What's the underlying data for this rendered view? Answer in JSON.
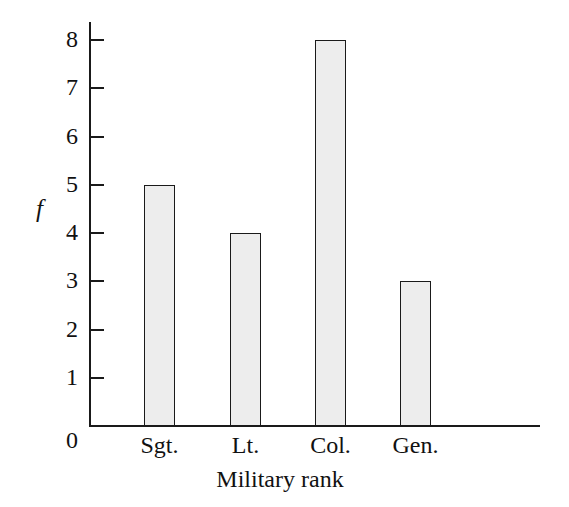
{
  "chart_data": {
    "type": "bar",
    "title": "",
    "categories": [
      "Sgt.",
      "Lt.",
      "Col.",
      "Gen."
    ],
    "values": [
      5,
      4,
      8,
      3
    ],
    "xlabel": "Military rank",
    "ylabel": "f",
    "ylim": [
      0,
      8
    ],
    "yticks": [
      0,
      1,
      2,
      3,
      4,
      5,
      6,
      7,
      8
    ],
    "ytick_labels": [
      "0",
      "1",
      "2",
      "3",
      "4",
      "5",
      "6",
      "7",
      "8"
    ],
    "grid": false,
    "legend": null,
    "bar_fill_color": "#ededed",
    "bar_edge_color": "#1a1a1a",
    "axis_color": "#1a1a1a",
    "background_color": "#ffffff"
  },
  "axes": {
    "y_title": "f",
    "x_title": "Military rank",
    "zero_label": "0",
    "tick_labels": [
      "1",
      "2",
      "3",
      "4",
      "5",
      "6",
      "7",
      "8"
    ]
  },
  "bars": [
    {
      "label": "Sgt.",
      "value": 5
    },
    {
      "label": "Lt.",
      "value": 4
    },
    {
      "label": "Col.",
      "value": 8
    },
    {
      "label": "Gen.",
      "value": 3
    }
  ]
}
